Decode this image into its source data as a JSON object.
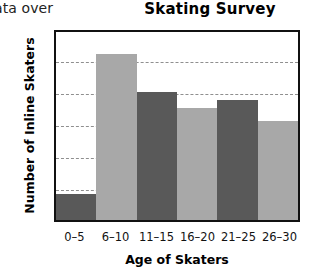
{
  "page_fragment": "ata over",
  "chart_data": {
    "type": "bar",
    "title": "Skating Survey",
    "xlabel": "Age of Skaters",
    "ylabel": "Number of Inline Skaters",
    "categories": [
      "0–5",
      "6–10",
      "11–15",
      "16–20",
      "21–25",
      "26–30"
    ],
    "values": [
      4,
      26,
      20,
      17.5,
      18.8,
      15.5
    ],
    "bar_colors": [
      "#595959",
      "#a8a8a8",
      "#595959",
      "#a8a8a8",
      "#595959",
      "#a8a8a8"
    ],
    "ylim": [
      0,
      30
    ],
    "yticks": [
      0,
      5,
      10,
      15,
      20,
      25,
      30
    ],
    "ytick_labels": [
      "0",
      "5",
      "10",
      "15",
      "20",
      "25",
      "30"
    ],
    "grid": true,
    "gridline_color": "#8f8f8f",
    "frame_color": "#111111",
    "background": "#ffffff",
    "legend": null
  }
}
